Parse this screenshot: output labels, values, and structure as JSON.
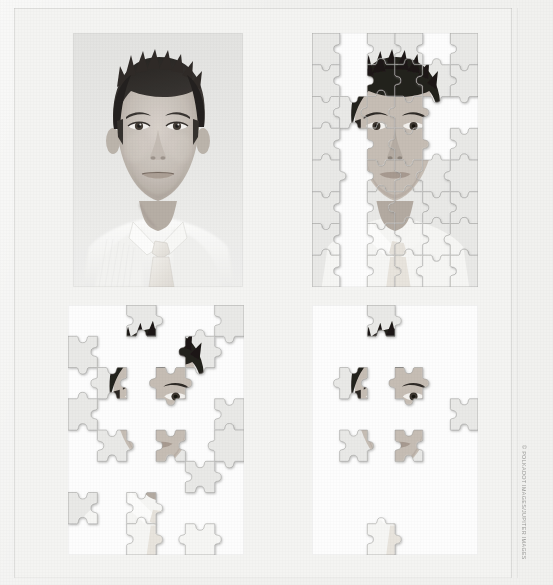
{
  "page": {
    "background_color": "#f1f1ef",
    "sheet_color": "#f4f4f2",
    "width": 553,
    "height": 585,
    "medium": "scanned print page"
  },
  "credit": {
    "text": "© POLKADOT IMAGES/JUPITER IMAGES",
    "orientation": "vertical",
    "color": "#9a9a98"
  },
  "figure": {
    "caption": "",
    "panel_count": 4,
    "sequence_label": "degradation sequence"
  },
  "panels": [
    {
      "id": "photo",
      "name": "original-photograph",
      "label": "",
      "type": "photo",
      "subject": "young man portrait",
      "color_mode": "black-and-white",
      "pieces_remaining": null,
      "grid": null,
      "x": 73,
      "y": 33,
      "width": 170,
      "height": 254
    },
    {
      "id": "stage1",
      "name": "puzzle-stage-1",
      "label": "",
      "type": "puzzle",
      "color_mode": "black-and-white",
      "pieces_remaining": 44,
      "grid": {
        "cols": 6,
        "rows": 8
      },
      "x": 312,
      "y": 33,
      "width": 166,
      "height": 254
    },
    {
      "id": "stage2",
      "name": "puzzle-stage-2",
      "label": "",
      "type": "puzzle",
      "color_mode": "black-and-white",
      "pieces_remaining": 20,
      "grid": {
        "cols": 6,
        "rows": 8
      },
      "x": 68,
      "y": 305,
      "width": 176,
      "height": 250
    },
    {
      "id": "stage3",
      "name": "puzzle-stage-3",
      "label": "",
      "type": "puzzle",
      "color_mode": "black-and-white",
      "pieces_remaining": 6,
      "grid": {
        "cols": 6,
        "rows": 8
      },
      "x": 312,
      "y": 305,
      "width": 166,
      "height": 250
    }
  ],
  "puzzle_layout": {
    "cols": 6,
    "rows": 8,
    "stage1_present": [
      [
        1,
        0,
        1,
        1,
        0,
        1
      ],
      [
        1,
        0,
        1,
        1,
        1,
        1
      ],
      [
        1,
        1,
        1,
        1,
        0,
        0
      ],
      [
        1,
        0,
        1,
        1,
        0,
        1
      ],
      [
        1,
        0,
        1,
        1,
        1,
        1
      ],
      [
        1,
        0,
        1,
        1,
        1,
        1
      ],
      [
        1,
        0,
        1,
        1,
        1,
        1
      ],
      [
        1,
        0,
        1,
        1,
        1,
        1
      ],
      [
        1,
        0,
        1,
        0,
        1,
        1
      ]
    ],
    "stage2_present": [
      [
        0,
        0,
        1,
        0,
        0,
        1
      ],
      [
        1,
        0,
        0,
        0,
        1,
        0
      ],
      [
        0,
        1,
        0,
        1,
        0,
        0
      ],
      [
        1,
        0,
        0,
        0,
        0,
        1
      ],
      [
        0,
        1,
        0,
        1,
        0,
        1
      ],
      [
        0,
        0,
        0,
        0,
        1,
        0
      ],
      [
        1,
        0,
        1,
        0,
        0,
        0
      ],
      [
        0,
        0,
        1,
        0,
        1,
        0
      ]
    ],
    "stage3_present": [
      [
        0,
        0,
        1,
        0,
        0,
        0
      ],
      [
        0,
        0,
        0,
        0,
        0,
        0
      ],
      [
        0,
        1,
        0,
        1,
        0,
        0
      ],
      [
        0,
        0,
        0,
        0,
        0,
        1
      ],
      [
        0,
        1,
        0,
        1,
        0,
        0
      ],
      [
        0,
        0,
        0,
        0,
        0,
        0
      ],
      [
        0,
        0,
        0,
        0,
        0,
        0
      ],
      [
        0,
        0,
        1,
        0,
        0,
        0
      ]
    ]
  }
}
